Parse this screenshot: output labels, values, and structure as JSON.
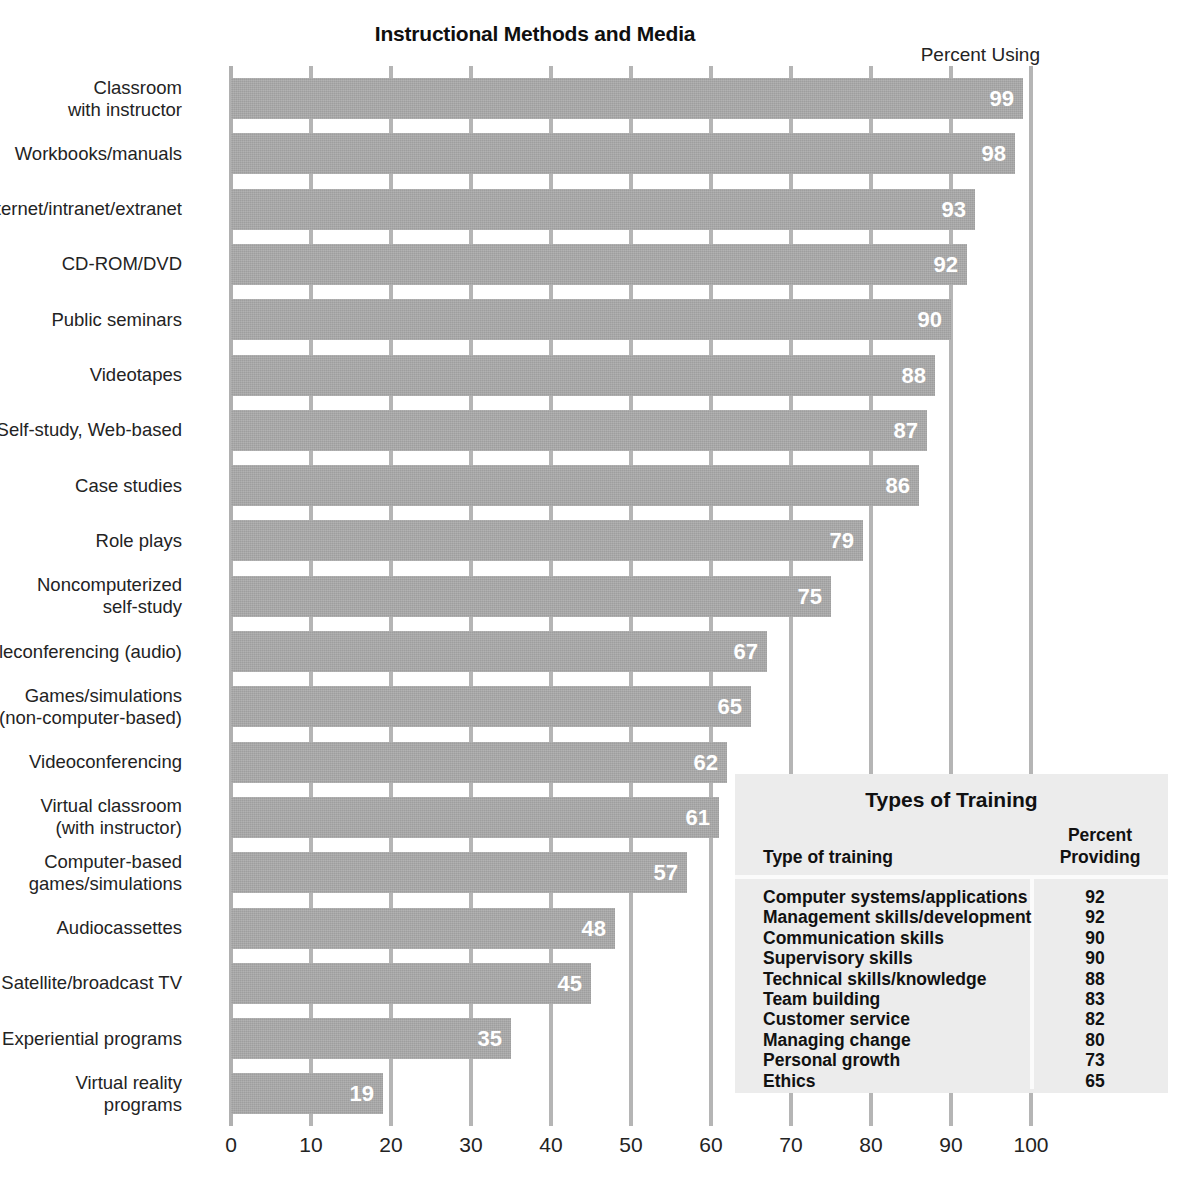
{
  "chart_data": {
    "type": "bar",
    "title": "Instructional Methods and Media",
    "value_axis_label": "Percent Using",
    "orientation": "horizontal",
    "xlabel": "",
    "ylabel": "",
    "xlim": [
      0,
      100
    ],
    "grid": true,
    "legend": "none",
    "xticks": [
      "0",
      "10",
      "20",
      "30",
      "40",
      "50",
      "60",
      "70",
      "80",
      "90",
      "100"
    ],
    "categories": [
      "Classroom\nwith instructor",
      "Workbooks/manuals",
      "Internet/intranet/extranet",
      "CD-ROM/DVD",
      "Public seminars",
      "Videotapes",
      "Self-study, Web-based",
      "Case studies",
      "Role plays",
      "Noncomputerized\nself-study",
      "Teleconferencing (audio)",
      "Games/simulations\n(non-computer-based)",
      "Videoconferencing",
      "Virtual classroom\n(with instructor)",
      "Computer-based\ngames/simulations",
      "Audiocassettes",
      "Satellite/broadcast TV",
      "Experiential programs",
      "Virtual reality\nprograms"
    ],
    "values": [
      99,
      98,
      93,
      92,
      90,
      88,
      87,
      86,
      79,
      75,
      67,
      65,
      62,
      61,
      57,
      48,
      45,
      35,
      19
    ],
    "bar_color": "#a9a9a9",
    "value_label_color": "#ffffff"
  },
  "table": {
    "title": "Types of Training",
    "columns": [
      "Type of training",
      "Percent\nProviding"
    ],
    "rows": [
      {
        "label": "Computer systems/applications",
        "value": "92"
      },
      {
        "label": "Management skills/development",
        "value": "92"
      },
      {
        "label": "Communication skills",
        "value": "90"
      },
      {
        "label": "Supervisory skills",
        "value": "90"
      },
      {
        "label": "Technical skills/knowledge",
        "value": "88"
      },
      {
        "label": "Team building",
        "value": "83"
      },
      {
        "label": "Customer service",
        "value": "82"
      },
      {
        "label": "Managing change",
        "value": "80"
      },
      {
        "label": "Personal growth",
        "value": "73"
      },
      {
        "label": "Ethics",
        "value": "65"
      }
    ],
    "background_color": "#ececec"
  }
}
